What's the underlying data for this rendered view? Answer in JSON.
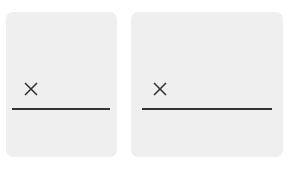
{
  "panels": [
    {
      "id": "left",
      "input_value": "",
      "icon": "close-icon"
    },
    {
      "id": "right",
      "input_value": "",
      "icon": "close-icon"
    }
  ],
  "colors": {
    "panel_bg": "#efefef",
    "line": "#333333",
    "icon": "#333333",
    "page_bg": "#ffffff"
  }
}
